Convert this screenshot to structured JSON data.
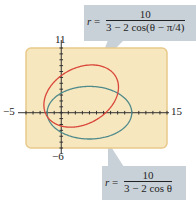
{
  "figure": {
    "window": {
      "xmin": -5,
      "xmax": 15,
      "ymin": -6,
      "ymax": 11
    },
    "labels": {
      "xmin": "−5",
      "xmax": "15",
      "ymin": "−6",
      "ymax": "11"
    },
    "colors": {
      "background": "#f7e7bf",
      "border": "#e8c98a",
      "axis": "#333333",
      "curve1": "#d9473a",
      "curve2": "#4f8a8b",
      "callout": "#c9d1d8"
    },
    "curves": [
      {
        "name": "rotated-ellipse",
        "numerator": "10",
        "denominator": "3 − 2 cos(θ − π/4)",
        "lhs": "r",
        "color": "#d9473a"
      },
      {
        "name": "ellipse",
        "numerator": "10",
        "denominator": "3 − 2 cos θ",
        "lhs": "r",
        "color": "#4f8a8b"
      }
    ]
  },
  "chart_data": {
    "type": "line",
    "title": "",
    "xlabel": "",
    "ylabel": "",
    "xlim": [
      -5,
      15
    ],
    "ylim": [
      -6,
      11
    ],
    "grid": false,
    "series": [
      {
        "name": "r = 10/(3 − 2cos(θ − π/4))",
        "color": "#d9473a",
        "polar": true
      },
      {
        "name": "r = 10/(3 − 2cos θ)",
        "color": "#4f8a8b",
        "polar": true
      }
    ]
  }
}
